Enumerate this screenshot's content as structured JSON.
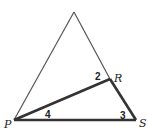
{
  "figure": {
    "type": "geometry-diagram",
    "vertices": {
      "apex": {
        "x": 74,
        "y": 12,
        "label": ""
      },
      "P": {
        "x": 14,
        "y": 120,
        "label": "P"
      },
      "R": {
        "x": 110,
        "y": 79,
        "label": "R"
      },
      "S": {
        "x": 136,
        "y": 120,
        "label": "S"
      }
    },
    "angle_labels": {
      "angle2": "2",
      "angle3": "3",
      "angle4": "4"
    },
    "colors": {
      "thin_line": "#555555",
      "thick_line": "#333333",
      "background": "#ffffff"
    }
  }
}
